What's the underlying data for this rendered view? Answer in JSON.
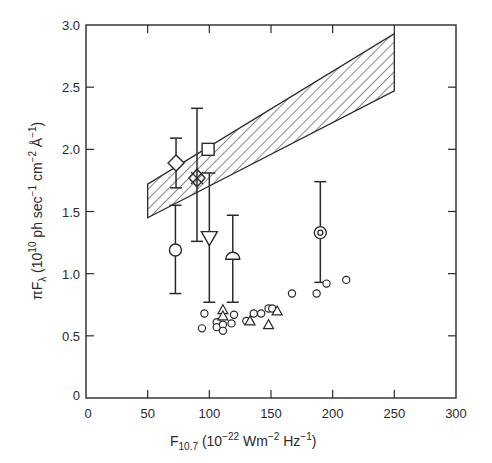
{
  "chart_data": {
    "type": "scatter",
    "title": "",
    "xlabel": "F10.7 (10^-22 Wm^-2 Hz^-1)",
    "ylabel": "πFλ (10^10 ph sec^-1 cm^-2 Å^-1)",
    "xlim": [
      0,
      300
    ],
    "ylim": [
      0,
      3.0
    ],
    "x_ticks": [
      0,
      50,
      100,
      150,
      200,
      250,
      300
    ],
    "y_ticks": [
      0,
      0.5,
      1.0,
      1.5,
      2.0,
      2.5,
      3.0
    ],
    "x_tick_labels": [
      "0",
      "50",
      "100",
      "150",
      "200",
      "250",
      "300"
    ],
    "y_tick_labels": [
      "0",
      "0.5",
      "1.0",
      "1.5",
      "2.0",
      "2.5",
      "3.0"
    ],
    "grid": false,
    "legend": null,
    "band": {
      "name": "hatched model range",
      "style": "diagonal-hatch",
      "x": [
        50,
        250
      ],
      "y_lower": [
        1.45,
        2.47
      ],
      "y_upper": [
        1.72,
        2.93
      ]
    },
    "series": [
      {
        "name": "diamond",
        "marker": "diamond",
        "points": [
          {
            "x": 73,
            "y": 1.89,
            "err_low": 1.69,
            "err_high": 2.09
          }
        ]
      },
      {
        "name": "circle-errbar",
        "marker": "circle",
        "points": [
          {
            "x": 72.5,
            "y": 1.19,
            "err_low": 0.84,
            "err_high": 1.55
          }
        ]
      },
      {
        "name": "crossed-diamond",
        "marker": "diamond-x",
        "points": [
          {
            "x": 90,
            "y": 1.77,
            "err_low": 1.26,
            "err_high": 2.33
          }
        ]
      },
      {
        "name": "square",
        "marker": "square",
        "points": [
          {
            "x": 99,
            "y": 2.0
          }
        ]
      },
      {
        "name": "down-triangle",
        "marker": "triangle-down",
        "points": [
          {
            "x": 100,
            "y": 1.29,
            "err_low": 0.77,
            "err_high": 1.81
          }
        ]
      },
      {
        "name": "semicircle",
        "marker": "semicircle",
        "points": [
          {
            "x": 119,
            "y": 1.14,
            "err_low": 0.77,
            "err_high": 1.47
          }
        ]
      },
      {
        "name": "bullseye",
        "marker": "bullseye",
        "points": [
          {
            "x": 190,
            "y": 1.33,
            "err_low": 0.93,
            "err_high": 1.74
          }
        ]
      },
      {
        "name": "open-circles",
        "marker": "circle-small",
        "points": [
          {
            "x": 96,
            "y": 0.68
          },
          {
            "x": 94,
            "y": 0.56
          },
          {
            "x": 106,
            "y": 0.61
          },
          {
            "x": 106,
            "y": 0.57
          },
          {
            "x": 111,
            "y": 0.59
          },
          {
            "x": 111,
            "y": 0.54
          },
          {
            "x": 118,
            "y": 0.6
          },
          {
            "x": 120,
            "y": 0.67
          },
          {
            "x": 130,
            "y": 0.62
          },
          {
            "x": 136,
            "y": 0.68
          },
          {
            "x": 142,
            "y": 0.68
          },
          {
            "x": 148,
            "y": 0.72
          },
          {
            "x": 151,
            "y": 0.72
          },
          {
            "x": 167,
            "y": 0.84
          },
          {
            "x": 187,
            "y": 0.84
          },
          {
            "x": 195,
            "y": 0.92
          },
          {
            "x": 211,
            "y": 0.95
          }
        ]
      },
      {
        "name": "open-triangles",
        "marker": "triangle-small",
        "points": [
          {
            "x": 111,
            "y": 0.71
          },
          {
            "x": 111,
            "y": 0.66
          },
          {
            "x": 133,
            "y": 0.62
          },
          {
            "x": 155,
            "y": 0.7
          },
          {
            "x": 148,
            "y": 0.59
          }
        ]
      }
    ]
  },
  "axes": {
    "x_title_main": "F",
    "x_title_sub": "10.7",
    "x_title_units_open": " (10",
    "x_title_exp1": "−22",
    "x_title_mid": " Wm",
    "x_title_exp2": "−2",
    "x_title_mid2": " Hz",
    "x_title_exp3": "−1",
    "x_title_close": ")",
    "y_title_main": "πF",
    "y_title_sub": "λ",
    "y_title_open": " (10",
    "y_title_exp1": "10",
    "y_title_mid1": " ph sec",
    "y_title_exp2": "−1",
    "y_title_mid2": " cm",
    "y_title_exp3": "−2",
    "y_title_mid3": " Å",
    "y_title_exp4": "−1",
    "y_title_close": ")"
  }
}
